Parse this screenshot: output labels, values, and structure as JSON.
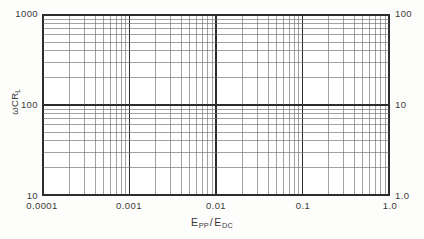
{
  "figure": {
    "background_color": "#fdfdfc",
    "plot_background_color": "#ffffff",
    "line_color": "#2c2c2c",
    "minor_line_color": "#6e6e6e",
    "text_color": "#3a3a38"
  },
  "axes": {
    "y_title_omega": "ω",
    "y_title_body": "CR",
    "y_title_sub": "L",
    "x_title_num": "E",
    "x_title_num_sub": "PP",
    "x_title_sep": "/",
    "x_title_den": "E",
    "x_title_den_sub": "DC",
    "y_left_labels": [
      "1000",
      "100",
      "10"
    ],
    "y_right_labels": [
      "100",
      "10",
      "1.0"
    ],
    "x_labels": [
      "0.0001",
      "0.001",
      "0.01",
      "0.1",
      "1.0"
    ]
  },
  "chart_data": {
    "type": "line",
    "title": "",
    "subtitle": "",
    "xlabel": "EPP/EDC",
    "ylabel": "wCRL",
    "xscale": "log",
    "yscale": "log",
    "xlim": [
      0.0001,
      1.0
    ],
    "ylim": [
      10,
      1000
    ],
    "y_right_lim": [
      1.0,
      100
    ],
    "grid": true,
    "grid_style": "log-log graph paper, major decade lines plus minor 2-9 decade subdivisions on both axes",
    "legend": "none",
    "x_decades": 4,
    "y_decades": 2,
    "x_major_ticks": [
      0.0001,
      0.001,
      0.01,
      0.1,
      1.0
    ],
    "y_major_ticks_left": [
      10,
      100,
      1000
    ],
    "y_major_ticks_right": [
      1.0,
      10,
      100
    ],
    "minor_tick_multipliers": [
      2,
      3,
      4,
      5,
      6,
      7,
      8,
      9
    ],
    "series": [],
    "annotations": [],
    "note": "Blank log-log graph paper grid; no data curve is plotted in the figure."
  }
}
